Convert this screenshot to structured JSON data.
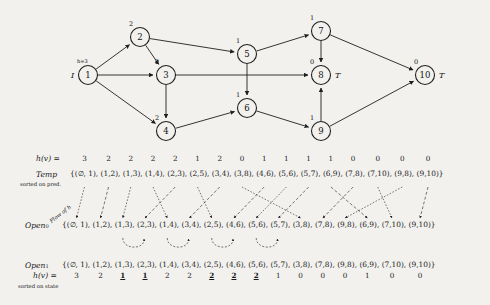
{
  "figure": {
    "title_hidden": "",
    "start_marker": "I",
    "goal_marker": "T",
    "start_h_label": "h=3",
    "flow_label": "Flow of h"
  },
  "graph": {
    "nodes": [
      {
        "id": "1",
        "x": 88,
        "y": 75,
        "h": "",
        "h_above": "",
        "marker": "I",
        "marker_side": "left"
      },
      {
        "id": "2",
        "x": 140,
        "y": 37,
        "h": "2",
        "marker": ""
      },
      {
        "id": "3",
        "x": 166,
        "y": 75,
        "h": "2",
        "marker": ""
      },
      {
        "id": "4",
        "x": 166,
        "y": 131,
        "h": "2",
        "marker": ""
      },
      {
        "id": "5",
        "x": 247,
        "y": 54,
        "h": "1",
        "marker": ""
      },
      {
        "id": "6",
        "x": 247,
        "y": 108,
        "h": "1",
        "marker": ""
      },
      {
        "id": "7",
        "x": 321,
        "y": 31,
        "h": "1",
        "marker": ""
      },
      {
        "id": "8",
        "x": 321,
        "y": 75,
        "h": "0",
        "marker": "T",
        "marker_side": "right"
      },
      {
        "id": "9",
        "x": 321,
        "y": 131,
        "h": "1",
        "marker": ""
      },
      {
        "id": "10",
        "x": 425,
        "y": 75,
        "h": "0",
        "marker": "T",
        "marker_side": "right"
      }
    ],
    "edges": [
      {
        "from": "1",
        "to": "2"
      },
      {
        "from": "1",
        "to": "3"
      },
      {
        "from": "1",
        "to": "4"
      },
      {
        "from": "2",
        "to": "3"
      },
      {
        "from": "2",
        "to": "5"
      },
      {
        "from": "3",
        "to": "4"
      },
      {
        "from": "3",
        "to": "8"
      },
      {
        "from": "4",
        "to": "6"
      },
      {
        "from": "5",
        "to": "6"
      },
      {
        "from": "5",
        "to": "7"
      },
      {
        "from": "6",
        "to": "9"
      },
      {
        "from": "7",
        "to": "8"
      },
      {
        "from": "7",
        "to": "10"
      },
      {
        "from": "9",
        "to": "8"
      },
      {
        "from": "9",
        "to": "10"
      }
    ]
  },
  "h_row": {
    "label": "h(v) =",
    "values": [
      "3",
      "2",
      "2",
      "2",
      "2",
      "1",
      "2",
      "0",
      "1",
      "1",
      "1",
      "1",
      "0",
      "0",
      "0",
      "0"
    ]
  },
  "temp_row": {
    "label": "Temp",
    "note": "sorted on pred.",
    "pairs": [
      "(∅, 1)",
      "(1,2)",
      "(1,3)",
      "(1,4)",
      "(2,3)",
      "(2,5)",
      "(3,4)",
      "(3,8)",
      "(4,6)",
      "(5,6)",
      "(5,7)",
      "(6,9)",
      "(7,8)",
      "(7,10)",
      "(9,8)",
      "(9,10)"
    ]
  },
  "open0_row": {
    "label": "Open",
    "subscript": "0",
    "pairs": [
      "(∅, 1)",
      "(1,2)",
      "(1,3)",
      "(2,3)",
      "(1,4)",
      "(3,4)",
      "(2,5)",
      "(4,6)",
      "(5,6)",
      "(5,7)",
      "(3,8)",
      "(7,8)",
      "(9,8)",
      "(6,9)",
      "(7,10)",
      "(9,10)"
    ]
  },
  "open1_row": {
    "label": "Open",
    "subscript": "1",
    "h_label": "h(v) =",
    "note": "sorted on state",
    "pairs": [
      "(∅, 1)",
      "(1,2)",
      "(1,3)",
      "(2,3)",
      "(1,4)",
      "(3,4)",
      "(2,5)",
      "(4,6)",
      "(5,6)",
      "(5,7)",
      "(3,8)",
      "(7,8)",
      "(9,8)",
      "(6,9)",
      "(7,10)",
      "(9,10)"
    ],
    "values": [
      "3",
      "2",
      "1",
      "1",
      "2",
      "2",
      "2",
      "2",
      "2",
      "1",
      "0",
      "0",
      "0",
      "1",
      "0",
      "0"
    ],
    "emphasis": [
      false,
      false,
      true,
      true,
      false,
      false,
      true,
      true,
      true,
      false,
      false,
      false,
      false,
      false,
      false,
      false
    ]
  },
  "open0_interval_values": {
    "label_pairs": [
      {
        "value": "2",
        "index": 2
      },
      {
        "value": "2",
        "index": 3
      },
      {
        "value": "2",
        "index": 4
      },
      {
        "value": "2",
        "index": 5
      },
      {
        "value": "1",
        "index": 6
      },
      {
        "value": "1",
        "index": 7
      }
    ]
  },
  "colors": {
    "ink": "#1f1f1f",
    "paper": "#f2f1ee",
    "dashed": "#555555"
  }
}
